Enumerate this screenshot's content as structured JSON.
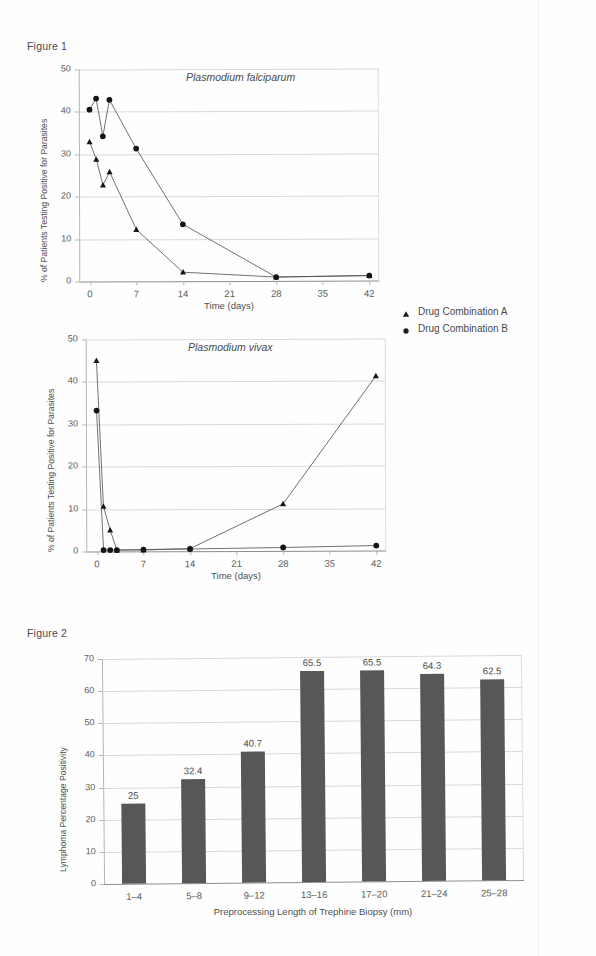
{
  "page": {
    "figure1_label": "Figure 1",
    "figure2_label": "Figure 2"
  },
  "legend": {
    "items": [
      {
        "label": "Drug Combination A",
        "marker": "triangle-marker"
      },
      {
        "label": "Drug Combination B",
        "marker": "circle-marker"
      }
    ]
  },
  "chart_data": [
    {
      "id": "falciparum",
      "type": "line",
      "title": "Plasmodium falciparum",
      "xlabel": "Time (days)",
      "ylabel": "% of Patients Testing Positive for Parasites",
      "xlim": [
        -1.6,
        43.5
      ],
      "ylim": [
        0,
        50
      ],
      "xticks": [
        0,
        7,
        14,
        21,
        28,
        35,
        42
      ],
      "yticks": [
        0,
        10,
        20,
        30,
        40,
        50
      ],
      "grid": true,
      "legend_position": "right-outside",
      "series": [
        {
          "name": "Drug Combination A",
          "marker": "triangle",
          "x": [
            0,
            1,
            2,
            3,
            7,
            14,
            28,
            42
          ],
          "values": [
            32.9,
            28.8,
            22.7,
            25.8,
            12.2,
            2.1,
            0.9,
            1.2
          ]
        },
        {
          "name": "Drug Combination B",
          "marker": "circle",
          "x": [
            0,
            1,
            2,
            3,
            7,
            14,
            28,
            42
          ],
          "values": [
            40.5,
            43.1,
            34.2,
            42.8,
            31.3,
            13.4,
            0.9,
            1.2
          ]
        }
      ]
    },
    {
      "id": "vivax",
      "type": "line",
      "title": "Plasmodium vivax",
      "xlabel": "Time (days)",
      "ylabel": "% of Patients Testing Positive for Parasites",
      "xlim": [
        -1.6,
        43.5
      ],
      "ylim": [
        0,
        50
      ],
      "xticks": [
        0,
        7,
        14,
        21,
        28,
        35,
        42
      ],
      "yticks": [
        0,
        10,
        20,
        30,
        40,
        50
      ],
      "grid": true,
      "legend_position": "shared-with-figure-1",
      "series": [
        {
          "name": "Drug Combination A",
          "marker": "triangle",
          "x": [
            0,
            1,
            2,
            3,
            7,
            14,
            28,
            42
          ],
          "values": [
            45.0,
            10.6,
            5.0,
            0.3,
            0.3,
            0.6,
            11.1,
            41.2
          ]
        },
        {
          "name": "Drug Combination B",
          "marker": "circle",
          "x": [
            0,
            1,
            2,
            3,
            7,
            14,
            28,
            42
          ],
          "values": [
            33.2,
            0.3,
            0.3,
            0.3,
            0.4,
            0.5,
            0.8,
            1.2
          ]
        }
      ]
    },
    {
      "id": "lymphoma-biopsy",
      "type": "bar",
      "title": "",
      "xlabel": "Preprocessing Length of Trephine Biopsy (mm)",
      "ylabel": "Lymphoma Percentage Positivity",
      "categories": [
        "1–4",
        "5–8",
        "9–12",
        "13–16",
        "17–20",
        "21–24",
        "25–28"
      ],
      "values": [
        25,
        32.4,
        40.7,
        65.5,
        65.5,
        64.3,
        62.5
      ],
      "value_labels": [
        "25",
        "32.4",
        "40.7",
        "65.5",
        "65.5",
        "64.3",
        "62.5"
      ],
      "ylim": [
        0,
        70
      ],
      "yticks": [
        0,
        10,
        20,
        30,
        40,
        50,
        60,
        70
      ],
      "grid": true,
      "bar_color": "#575757"
    }
  ]
}
